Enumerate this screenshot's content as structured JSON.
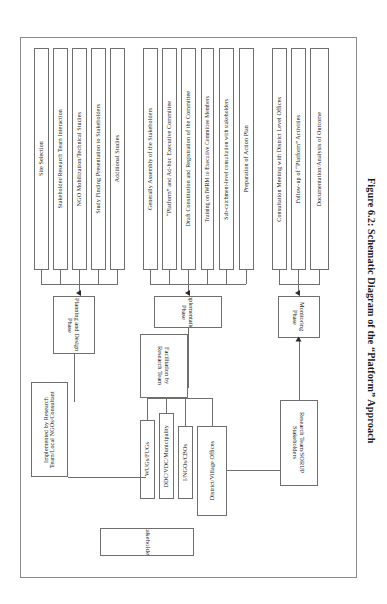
{
  "figure": {
    "caption": "Figure 6.2: Schematic Diagram of the “Platform” Approach",
    "orientation": "rotated-90-ccw"
  },
  "phases": [
    {
      "id": "planning-design",
      "label": "Planning and Design Phase",
      "actor": "Implemented by Research Team/Local NGOs/Consultant",
      "activities": [
        "Site Selection",
        "Stakeholder/Research Team Interaction",
        "NGO Mobilization/Technical Studies",
        "Study Finding Presentation to Stakeholders",
        "Additional Studies"
      ]
    },
    {
      "id": "implementation",
      "label": "Implementation Phase",
      "actor": "Facilitation by Research Team",
      "activities": [
        "Generally Assembly of the Stakeholders",
        "“Platform” and Ad-hoc Executive Committee",
        "Draft Constitution and Registration of the Committee",
        "Training on IWRM to Executive Committee Members",
        "Sub-catchment-level consultation with stakeholders",
        "Preparation of Action Plan"
      ]
    },
    {
      "id": "monitoring",
      "label": "Monitoring Phase",
      "actor": "Research Team/SORUP Stakeholders",
      "activities": [
        "Consultation Meeting with District Level Offices",
        "Follow-up of “Platform” Activities",
        "Documentation/Analysis of Outcome"
      ]
    }
  ],
  "stakeholders": {
    "label": "Stakeholders",
    "groups": [
      "WUGs/FUGs",
      "DDC/VDC/Municipality",
      "I/NGOs/CBOs",
      "District/Village Offices"
    ]
  },
  "colors": {
    "box_border": "#6f6f6f",
    "frame_border": "#8a8a8a",
    "arrow": "#2b2b2b",
    "text": "#1a1a1a",
    "background": "#ffffff"
  }
}
